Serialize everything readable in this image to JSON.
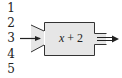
{
  "diagram": {
    "type": "function-machine",
    "inputs": [
      "1",
      "2",
      "3",
      "4",
      "5"
    ],
    "selected_input": "3",
    "rule": {
      "variable": "x",
      "operator": "+",
      "constant": "2"
    },
    "colors": {
      "machine_fill": "#e6e6e6",
      "stroke": "#333333",
      "text": "#222222"
    }
  }
}
